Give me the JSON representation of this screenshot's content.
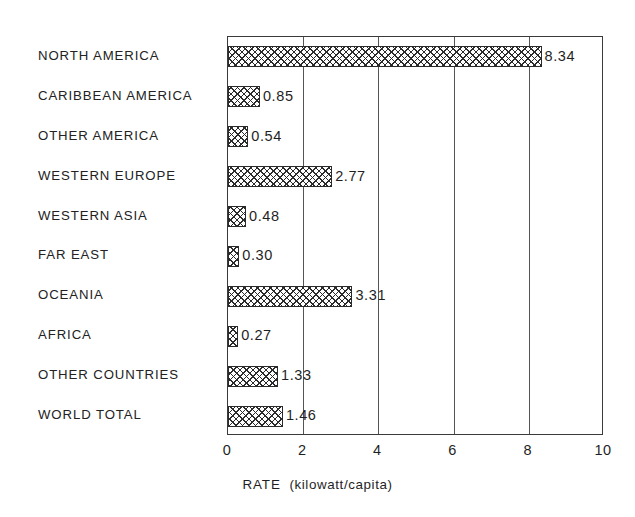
{
  "chart_data": {
    "type": "bar",
    "orientation": "horizontal",
    "title": "",
    "xlabel": "RATE (kilowatt/capita)",
    "ylabel": "",
    "xlim": [
      0,
      10
    ],
    "xticks": [
      "0",
      "2",
      "4",
      "6",
      "8",
      "10"
    ],
    "xtick_values": [
      0,
      2,
      4,
      6,
      8,
      10
    ],
    "grid": "vertical gridlines at 2, 4, 6, 8",
    "legend": "none",
    "bar_fill": "cross-hatch pattern",
    "categories": [
      "NORTH AMERICA",
      "CARIBBEAN AMERICA",
      "OTHER AMERICA",
      "WESTERN EUROPE",
      "WESTERN ASIA",
      "FAR EAST",
      "OCEANIA",
      "AFRICA",
      "OTHER COUNTRIES",
      "WORLD TOTAL"
    ],
    "values": [
      8.34,
      0.85,
      0.54,
      2.77,
      0.48,
      0.3,
      3.31,
      0.27,
      1.33,
      1.46
    ],
    "value_labels": [
      "8.34",
      "0.85",
      "0.54",
      "2.77",
      "0.48",
      "0.30",
      "3.31",
      "0.27",
      "1.33",
      "1.46"
    ]
  },
  "axis": {
    "title_main": "RATE",
    "title_unit": "(kilowatt/capita)",
    "title_full": "RATE  (kilowatt/capita)"
  },
  "colors": {
    "background": "#ffffff",
    "frame": "#3a3a3a",
    "bar_outline": "#2a2a2a",
    "hatch": "#2b2b2b",
    "text": "#1f1f1f"
  }
}
